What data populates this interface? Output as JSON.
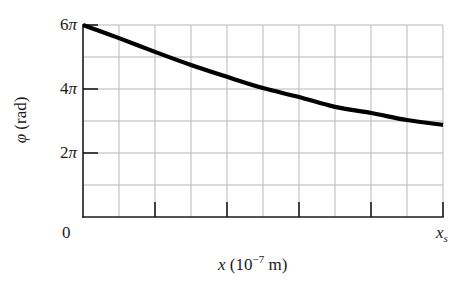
{
  "chart_data": {
    "type": "line",
    "title": "",
    "xlabel": "x (10^-7 m)",
    "ylabel": "φ (rad)",
    "xlabel_parts": {
      "var": "x",
      "open": " (10",
      "exp": "−7",
      "close": " m)"
    },
    "ylabel_parts": {
      "var": "φ",
      "unit": " (rad)"
    },
    "x_tick_labels": [
      {
        "text": "0",
        "position": 0
      },
      {
        "text": "x",
        "sub": "s",
        "position": 10
      }
    ],
    "y_tick_labels": [
      {
        "num": "6",
        "sym": "π",
        "value_pi": 6
      },
      {
        "num": "4",
        "sym": "π",
        "value_pi": 4
      },
      {
        "num": "2",
        "sym": "π",
        "value_pi": 2
      }
    ],
    "xlim": [
      0,
      10
    ],
    "ylim_in_pi": [
      0,
      6
    ],
    "grid": true,
    "grid_columns": 10,
    "grid_rows": 6,
    "legend": null,
    "series": [
      {
        "name": "φ(x)",
        "x_grid_units": [
          0,
          1,
          2,
          3,
          4,
          5,
          6,
          7,
          8,
          9,
          10
        ],
        "y_in_pi": [
          6.0,
          5.59,
          5.16,
          4.75,
          4.38,
          4.03,
          3.75,
          3.44,
          3.25,
          3.03,
          2.88
        ],
        "color": "#000000"
      }
    ]
  },
  "colors": {
    "grid": "#b8b8b8",
    "axis": "#1a1a1a",
    "curve": "#000000",
    "background": "#ffffff"
  },
  "layout": {
    "plot_left": 83,
    "plot_right": 443,
    "plot_top": 25,
    "plot_bottom": 217
  }
}
